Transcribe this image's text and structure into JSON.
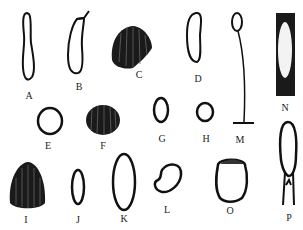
{
  "figure": {
    "labels": {
      "A": "A",
      "B": "B",
      "C": "C",
      "D": "D",
      "E": "E",
      "F": "F",
      "G": "G",
      "H": "H",
      "I": "I",
      "J": "J",
      "K": "K",
      "L": "L",
      "M": "M",
      "N": "N",
      "O": "O",
      "P": "P"
    }
  }
}
